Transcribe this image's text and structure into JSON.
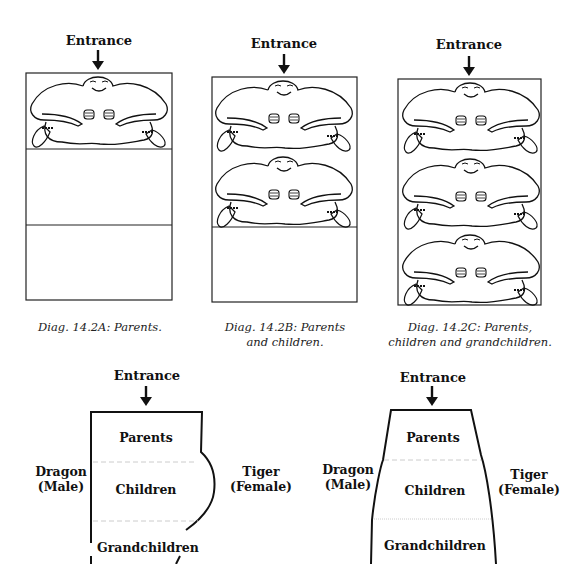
{
  "diagrams": {
    "a": {
      "entrance": "Entrance",
      "caption_line1": "Diag. 14.2A: Parents.",
      "caption_line2": ""
    },
    "b": {
      "entrance": "Entrance",
      "caption_line1": "Diag. 14.2B: Parents",
      "caption_line2": "and children."
    },
    "c": {
      "entrance": "Entrance",
      "caption_line1": "Diag. 14.2C: Parents,",
      "caption_line2": "children and grandchildren."
    }
  },
  "bottom_left": {
    "entrance": "Entrance",
    "left_label_1": "Dragon",
    "left_label_2": "(Male)",
    "right_label_1": "Tiger",
    "right_label_2": "(Female)",
    "zones": [
      "Parents",
      "Children",
      "Grandchildren"
    ]
  },
  "bottom_right": {
    "entrance": "Entrance",
    "left_label_1": "Dragon",
    "left_label_2": "(Male)",
    "right_label_1": "Tiger",
    "right_label_2": "(Female)",
    "zones": [
      "Parents",
      "Children",
      "Grandchildren"
    ]
  },
  "colors": {
    "ink": "#111111",
    "divider": "#bbbbbb",
    "background": "#ffffff"
  }
}
